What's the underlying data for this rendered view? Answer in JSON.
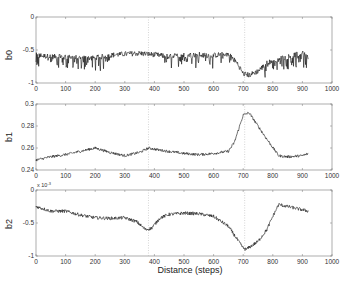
{
  "chart_data": [
    {
      "type": "line",
      "ylabel": "b0",
      "xlabel": "",
      "xlim": [
        0,
        1000
      ],
      "ylim": [
        -1,
        0
      ],
      "xticks": [
        "0",
        "100",
        "200",
        "300",
        "400",
        "500",
        "600",
        "700",
        "800",
        "900",
        "1000"
      ],
      "yticks": [
        "0",
        "-0.5",
        "-1"
      ],
      "ytick_values": [
        0,
        -0.5,
        -1
      ],
      "vlines": [
        380,
        705
      ],
      "grid": false,
      "noise": 0.04,
      "spikes": 0.18,
      "series": [
        {
          "name": "b0",
          "x": [
            0,
            50,
            100,
            150,
            200,
            250,
            300,
            350,
            400,
            450,
            500,
            550,
            600,
            650,
            680,
            700,
            720,
            750,
            780,
            800,
            850,
            900,
            920
          ],
          "values": [
            -0.58,
            -0.6,
            -0.6,
            -0.62,
            -0.62,
            -0.58,
            -0.56,
            -0.55,
            -0.57,
            -0.6,
            -0.58,
            -0.57,
            -0.58,
            -0.56,
            -0.7,
            -0.86,
            -0.88,
            -0.82,
            -0.7,
            -0.66,
            -0.6,
            -0.55,
            -0.6
          ]
        }
      ]
    },
    {
      "type": "line",
      "ylabel": "b1",
      "xlabel": "",
      "xlim": [
        0,
        1000
      ],
      "ylim": [
        0.24,
        0.3
      ],
      "xticks": [
        "0",
        "100",
        "200",
        "300",
        "400",
        "500",
        "600",
        "700",
        "800",
        "900",
        "1000"
      ],
      "yticks": [
        "0.3",
        "0.28",
        "0.26",
        "0.24"
      ],
      "ytick_values": [
        0.3,
        0.28,
        0.26,
        0.24
      ],
      "vlines": [
        380,
        705
      ],
      "grid": false,
      "noise": 0.0012,
      "spikes": 0,
      "series": [
        {
          "name": "b1",
          "x": [
            0,
            50,
            100,
            150,
            200,
            250,
            300,
            350,
            380,
            420,
            500,
            550,
            600,
            650,
            670,
            700,
            720,
            750,
            780,
            820,
            850,
            900,
            920
          ],
          "values": [
            0.249,
            0.252,
            0.254,
            0.257,
            0.26,
            0.256,
            0.253,
            0.256,
            0.26,
            0.258,
            0.255,
            0.254,
            0.255,
            0.257,
            0.265,
            0.29,
            0.292,
            0.28,
            0.268,
            0.253,
            0.252,
            0.253,
            0.255
          ]
        }
      ]
    },
    {
      "type": "line",
      "ylabel": "b2",
      "xlabel": "Distance (steps)",
      "xlim": [
        0,
        1000
      ],
      "ylim": [
        -1,
        0
      ],
      "y_multiplier": "x 10^-3",
      "xticks": [
        "0",
        "100",
        "200",
        "300",
        "400",
        "500",
        "600",
        "700",
        "800",
        "900",
        "1000"
      ],
      "yticks": [
        "0",
        "-0.5",
        "-1"
      ],
      "ytick_values": [
        0,
        -0.5,
        -1
      ],
      "vlines": [
        380,
        705
      ],
      "grid": false,
      "noise": 0.025,
      "spikes": 0,
      "series": [
        {
          "name": "b2",
          "x": [
            0,
            50,
            100,
            150,
            200,
            250,
            300,
            340,
            370,
            390,
            420,
            450,
            500,
            550,
            600,
            650,
            680,
            700,
            710,
            750,
            780,
            800,
            820,
            850,
            900,
            920
          ],
          "values": [
            -0.25,
            -0.32,
            -0.32,
            -0.38,
            -0.42,
            -0.43,
            -0.42,
            -0.48,
            -0.6,
            -0.58,
            -0.42,
            -0.37,
            -0.35,
            -0.36,
            -0.4,
            -0.55,
            -0.75,
            -0.88,
            -0.9,
            -0.78,
            -0.6,
            -0.4,
            -0.22,
            -0.25,
            -0.3,
            -0.32
          ]
        }
      ]
    }
  ],
  "labels": {
    "ylabels": [
      "b0",
      "b1",
      "b2"
    ],
    "xlabel": "Distance (steps)",
    "exponent_base": "x 10",
    "exponent_power": "-3"
  }
}
